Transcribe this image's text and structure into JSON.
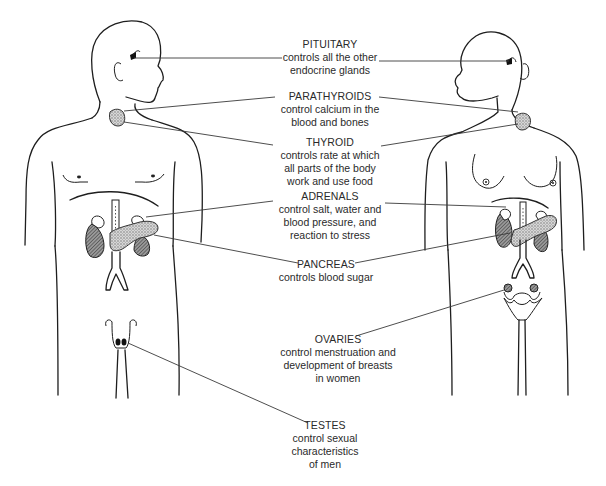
{
  "diagram": {
    "figures": [
      {
        "name": "male-figure",
        "facing": "right"
      },
      {
        "name": "female-figure",
        "facing": "left"
      }
    ],
    "colors": {
      "line": "#1e1e1e",
      "leader": "#3a3a3a",
      "stipple": "#8a8a8a",
      "kidney": "#6a6a6a",
      "text": "#2a2a2a",
      "background": "#ffffff"
    }
  },
  "glands": [
    {
      "id": "pituitary",
      "title": "PITUITARY",
      "desc": "controls all the other\nendocrine glands",
      "points_to": [
        "male",
        "female"
      ]
    },
    {
      "id": "parathyroids",
      "title": "PARATHYROIDS",
      "desc": "control calcium in the\nblood and bones",
      "points_to": [
        "male",
        "female"
      ]
    },
    {
      "id": "thyroid",
      "title": "THYROID",
      "desc": "controls rate at which\nall parts of the body\nwork and use food",
      "points_to": [
        "male",
        "female"
      ]
    },
    {
      "id": "adrenals",
      "title": "ADRENALS",
      "desc": "control salt, water and\nblood pressure, and\nreaction to stress",
      "points_to": [
        "male",
        "female"
      ]
    },
    {
      "id": "pancreas",
      "title": "PANCREAS",
      "desc": "controls blood sugar",
      "points_to": [
        "male",
        "female"
      ]
    },
    {
      "id": "ovaries",
      "title": "OVARIES",
      "desc": "control menstruation and\ndevelopment of breasts\nin women",
      "points_to": [
        "female"
      ]
    },
    {
      "id": "testes",
      "title": "TESTES",
      "desc": "control sexual\ncharacteristics\nof men",
      "points_to": [
        "male"
      ]
    }
  ]
}
